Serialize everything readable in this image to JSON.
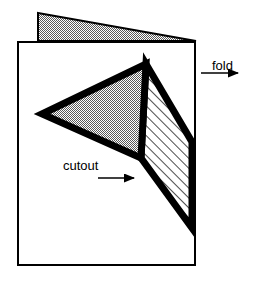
{
  "figure": {
    "background_color": "#ffffff",
    "line_color": "#000000",
    "fill_gray": "#a8a8a8",
    "fill_white": "#ffffff"
  },
  "labels": {
    "fold": "fold",
    "cutout": "cutout"
  },
  "shapes": {
    "back_flap": {
      "name": "back-flap-wedge",
      "fill": "gray",
      "points": "38,13 196,41 38,41"
    },
    "front_panel": {
      "name": "front-panel",
      "fill": "white",
      "points": "18,42 195,42 195,265 18,265"
    },
    "gray_triangle": {
      "name": "cutout-gray-triangle",
      "fill": "gray",
      "points": "42,114 146,64 141,158"
    },
    "hatched_region": {
      "name": "cutout-hatched-region",
      "fill": "hatch",
      "points": "146,64 192,142 192,228 141,158"
    }
  },
  "arrows": {
    "fold_arrow": {
      "name": "fold-arrow",
      "direction": "left",
      "from_x": 238,
      "to_x": 196,
      "y": 73
    },
    "cutout_arrow": {
      "name": "cutout-arrow",
      "direction": "right",
      "from_x": 98,
      "to_x": 144,
      "y": 178
    }
  }
}
